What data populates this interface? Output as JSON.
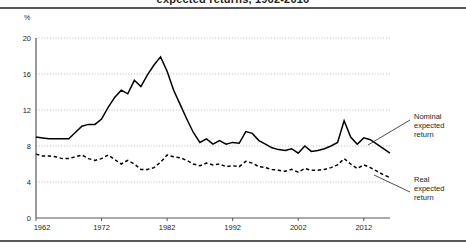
{
  "header": {
    "title": "expected returns, 1962-2016"
  },
  "chart_data": {
    "type": "line",
    "title": "expected returns, 1962-2016",
    "xlabel": "",
    "ylabel": "%",
    "unit_label": "%",
    "xlim": [
      1962,
      2016
    ],
    "ylim": [
      0,
      20
    ],
    "yticks": [
      0,
      4,
      8,
      12,
      16,
      20
    ],
    "xticks": [
      1962,
      1972,
      1982,
      1992,
      2002,
      2012
    ],
    "grid": "horizontal-dotted",
    "legend_position": "right-annotations",
    "x": [
      1962,
      1963,
      1964,
      1965,
      1966,
      1967,
      1968,
      1969,
      1970,
      1971,
      1972,
      1973,
      1974,
      1975,
      1976,
      1977,
      1978,
      1979,
      1980,
      1981,
      1982,
      1983,
      1984,
      1985,
      1986,
      1987,
      1988,
      1989,
      1990,
      1991,
      1992,
      1993,
      1994,
      1995,
      1996,
      1997,
      1998,
      1999,
      2000,
      2001,
      2002,
      2003,
      2004,
      2005,
      2006,
      2007,
      2008,
      2009,
      2010,
      2011,
      2012,
      2013,
      2014,
      2015,
      2016
    ],
    "series": [
      {
        "name": "Nominal expected return",
        "style": "solid",
        "color": "#000000",
        "values": [
          9.0,
          8.9,
          8.8,
          8.8,
          8.8,
          8.8,
          9.5,
          10.2,
          10.4,
          10.4,
          11.0,
          12.3,
          13.4,
          14.2,
          13.8,
          15.3,
          14.6,
          15.9,
          17.0,
          17.9,
          16.3,
          14.2,
          12.6,
          11.0,
          9.5,
          8.4,
          8.8,
          8.2,
          8.6,
          8.2,
          8.4,
          8.3,
          9.6,
          9.4,
          8.6,
          8.2,
          7.8,
          7.6,
          7.5,
          7.7,
          7.2,
          8.0,
          7.4,
          7.5,
          7.7,
          8.0,
          8.4,
          10.8,
          9.0,
          8.2,
          8.9,
          8.7,
          8.2,
          7.7,
          7.2
        ]
      },
      {
        "name": "Real expected return",
        "style": "dashed",
        "color": "#000000",
        "values": [
          7.1,
          6.9,
          6.9,
          6.8,
          6.6,
          6.6,
          6.8,
          7.0,
          6.6,
          6.4,
          6.6,
          7.0,
          6.5,
          6.0,
          6.4,
          6.0,
          5.4,
          5.4,
          5.6,
          6.2,
          7.0,
          6.8,
          6.7,
          6.4,
          6.0,
          5.8,
          6.1,
          5.9,
          6.0,
          5.7,
          5.8,
          5.7,
          6.3,
          6.1,
          5.7,
          5.6,
          5.4,
          5.3,
          5.2,
          5.4,
          5.1,
          5.5,
          5.3,
          5.3,
          5.4,
          5.6,
          5.9,
          6.6,
          6.0,
          5.5,
          5.9,
          5.6,
          5.2,
          4.8,
          4.5
        ]
      }
    ],
    "annotations": [
      {
        "name": "nominal-annotation",
        "label": "Nominal\nexpected\nreturn",
        "line1": "Nominal",
        "line2": "expected",
        "line3": "return"
      },
      {
        "name": "real-annotation",
        "label": "Real\nexpected\nreturn",
        "line1": "Real",
        "line2": "expected",
        "line3": "return"
      }
    ]
  }
}
